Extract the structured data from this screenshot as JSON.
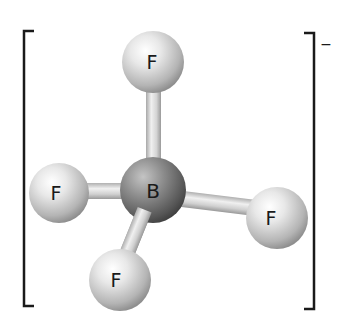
{
  "diagram": {
    "charge": "−",
    "central_atom": {
      "label": "B",
      "x": 153,
      "y": 190,
      "r": 33
    },
    "ligands": [
      {
        "id": "top",
        "label": "F",
        "x": 153,
        "y": 62,
        "r": 31
      },
      {
        "id": "left",
        "label": "F",
        "x": 59,
        "y": 193,
        "r": 30
      },
      {
        "id": "right",
        "label": "F",
        "x": 277,
        "y": 218,
        "r": 31
      },
      {
        "id": "bottom",
        "label": "F",
        "x": 120,
        "y": 280,
        "r": 31
      }
    ],
    "bonds": [
      {
        "from": "B",
        "to": "top"
      },
      {
        "from": "B",
        "to": "left"
      },
      {
        "from": "B",
        "to": "right"
      },
      {
        "from": "B",
        "to": "bottom"
      }
    ],
    "colors": {
      "fluorine_light": "#f4f4f4",
      "fluorine_dark": "#9a9a9a",
      "boron_light": "#a8a8a8",
      "boron_dark": "#4a4a4a",
      "bond_light": "#e6e6e6",
      "bond_dark": "#a0a0a0",
      "bracket": "#1a1a1a",
      "label": "#1a1a1a"
    }
  }
}
